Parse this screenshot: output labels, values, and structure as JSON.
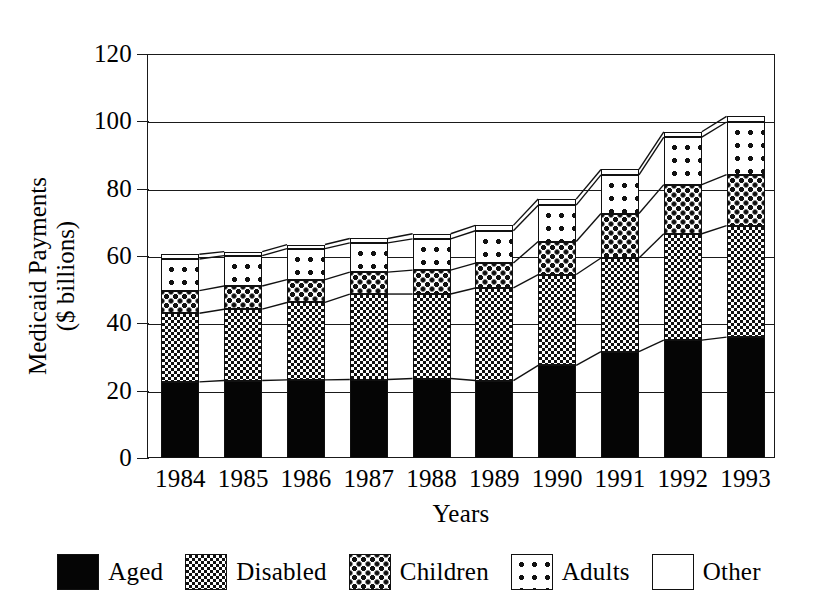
{
  "chart_data": {
    "type": "bar",
    "subtype": "stacked-bar",
    "title": "",
    "xlabel": "Years",
    "ylabel": "Medicaid Payments\n($ billions)",
    "ylabel_line1": "Medicaid Payments",
    "ylabel_line2": "($ billions)",
    "ylim": [
      0,
      120
    ],
    "yticks": [
      0,
      20,
      40,
      60,
      80,
      100,
      120
    ],
    "ytick_labels": [
      "0",
      "20",
      "40",
      "60",
      "80",
      "100",
      "120"
    ],
    "grid": "horizontal",
    "legend_position": "bottom",
    "categories": [
      "1984",
      "1985",
      "1986",
      "1987",
      "1988",
      "1989",
      "1990",
      "1991",
      "1992",
      "1993"
    ],
    "series": [
      {
        "name": "Aged",
        "pattern": "solid-black",
        "values": [
          22.6,
          23.0,
          23.2,
          23.3,
          23.6,
          23.0,
          27.5,
          31.6,
          35.0,
          35.9
        ]
      },
      {
        "name": "Disabled",
        "pattern": "fine-checkerboard",
        "values": [
          20.4,
          21.2,
          23.0,
          25.4,
          25.1,
          27.5,
          27.0,
          27.8,
          31.6,
          33.1
        ]
      },
      {
        "name": "Children",
        "pattern": "dense-dot-grid",
        "values": [
          6.7,
          6.9,
          6.8,
          6.5,
          7.1,
          7.4,
          9.8,
          13.2,
          14.6,
          15.2
        ]
      },
      {
        "name": "Adults",
        "pattern": "sparse-dot-grid",
        "values": [
          9.4,
          9.0,
          9.2,
          8.7,
          9.3,
          9.6,
          10.8,
          11.5,
          14.1,
          15.6
        ]
      },
      {
        "name": "Other",
        "pattern": "white",
        "values": [
          1.4,
          1.2,
          1.2,
          1.3,
          1.5,
          1.6,
          1.8,
          1.6,
          1.6,
          1.7
        ]
      }
    ],
    "totals": [
      60.5,
      61.3,
      63.4,
      65.2,
      66.6,
      69.1,
      76.9,
      85.7,
      96.9,
      101.5
    ]
  },
  "axes": {
    "y_title_line1": "Medicaid Payments",
    "y_title_line2": "($ billions)",
    "x_title": "Years"
  },
  "legend": {
    "items": [
      {
        "label": "Aged",
        "swatch": "solid-black-swatch"
      },
      {
        "label": "Disabled",
        "swatch": "checkerboard-swatch"
      },
      {
        "label": "Children",
        "swatch": "dense-dot-swatch"
      },
      {
        "label": "Adults",
        "swatch": "sparse-dot-swatch"
      },
      {
        "label": "Other",
        "swatch": "white-swatch"
      }
    ]
  },
  "colors": {
    "ink": "#111111",
    "background": "#ffffff"
  }
}
